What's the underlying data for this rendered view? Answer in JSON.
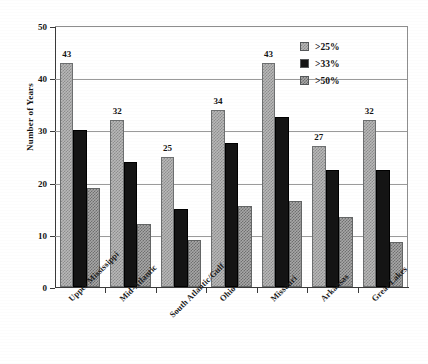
{
  "chart_data": {
    "type": "bar",
    "title": "",
    "xlabel": "",
    "ylabel": "Number of Years",
    "ylim": [
      0,
      50
    ],
    "yticks": [
      0,
      10,
      20,
      30,
      40,
      50
    ],
    "grid": true,
    "legend_position": "top-right",
    "categories": [
      "Upper Mississippi",
      "Mid-Atlantic",
      "South Atlantic/Gulf",
      "Ohio",
      "Missouri",
      "Arkansas",
      "Great Lakes"
    ],
    "series": [
      {
        "name": ">25%",
        "color": "#b9b9b9",
        "pattern": "light-checker",
        "values": [
          43,
          32,
          25,
          34,
          43,
          27,
          32
        ],
        "data_labels": [
          "43",
          "32",
          "25",
          "34",
          "43",
          "27",
          "32"
        ]
      },
      {
        "name": ">33%",
        "color": "#141414",
        "pattern": "solid-black",
        "values": [
          30,
          24,
          15,
          27.5,
          32.5,
          22.5,
          22.5
        ],
        "data_labels": [
          "",
          "",
          "",
          "",
          "",
          "",
          ""
        ]
      },
      {
        "name": ">50%",
        "color": "#a8a8a8",
        "pattern": "medium-checker",
        "values": [
          19,
          12,
          9,
          15.5,
          16.5,
          13.5,
          8.7
        ],
        "data_labels": [
          "",
          "",
          "",
          "",
          "",
          "",
          ""
        ]
      }
    ]
  }
}
